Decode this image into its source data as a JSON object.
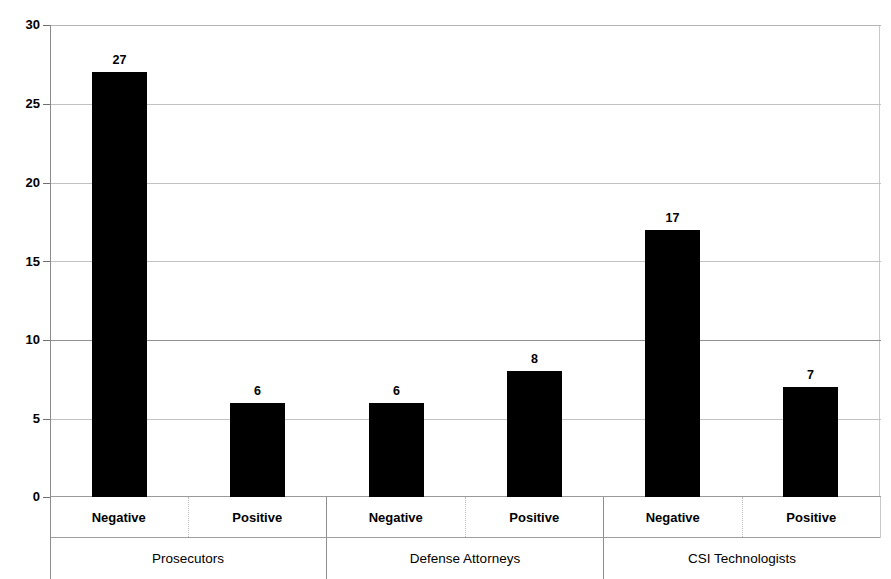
{
  "chart_data": {
    "type": "bar",
    "title": "",
    "subtitle": "",
    "xlabel": "",
    "ylabel": "",
    "ylim": [
      0,
      30
    ],
    "yticks": [
      0,
      5,
      10,
      15,
      20,
      25,
      30
    ],
    "ytick_labels": [
      "0",
      "5",
      "10",
      "15",
      "20",
      "25",
      "30"
    ],
    "grid": true,
    "grid_axis": "y",
    "legend": false,
    "legend_position": "none",
    "bar_color": "#000000",
    "categories": [
      "Negative",
      "Positive",
      "Negative",
      "Positive",
      "Negative",
      "Positive"
    ],
    "groups": [
      "Prosecutors",
      "Defense Attorneys",
      "CSI Technologists"
    ],
    "group_span": 2,
    "values": [
      27,
      6,
      6,
      8,
      17,
      7
    ],
    "data_labels": [
      "27",
      "6",
      "6",
      "8",
      "17",
      "7"
    ],
    "bars": [
      {
        "group": "Prosecutors",
        "category": "Negative",
        "value": 27,
        "label": "27"
      },
      {
        "group": "Prosecutors",
        "category": "Positive",
        "value": 6,
        "label": "6"
      },
      {
        "group": "Defense Attorneys",
        "category": "Negative",
        "value": 6,
        "label": "6"
      },
      {
        "group": "Defense Attorneys",
        "category": "Positive",
        "value": 8,
        "label": "8"
      },
      {
        "group": "CSI Technologists",
        "category": "Negative",
        "value": 17,
        "label": "17"
      },
      {
        "group": "CSI Technologists",
        "category": "Positive",
        "value": 7,
        "label": "7"
      }
    ]
  },
  "axis": {
    "y_labels": [
      "30",
      "25",
      "20",
      "15",
      "10",
      "5",
      "0"
    ]
  },
  "category_axis": {
    "cells": [
      {
        "label": "Negative"
      },
      {
        "label": "Positive"
      },
      {
        "label": "Negative"
      },
      {
        "label": "Positive"
      },
      {
        "label": "Negative"
      },
      {
        "label": "Positive"
      }
    ]
  },
  "group_axis": {
    "cells": [
      {
        "label": "Prosecutors"
      },
      {
        "label": "Defense Attorneys"
      },
      {
        "label": "CSI Technologists"
      }
    ]
  }
}
